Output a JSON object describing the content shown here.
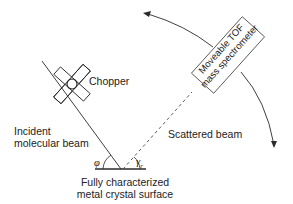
{
  "diagram": {
    "labels": {
      "chopper": "Chopper",
      "incident_line1": "Incident",
      "incident_line2": "molecular beam",
      "scattered": "Scattered beam",
      "spectrometer_line1": "Moveable TOF",
      "spectrometer_line2": "mass spectrometer",
      "surface_line1": "Fully characterized",
      "surface_line2": "metal crystal surface",
      "incident_angle": "φ",
      "scattered_angle": "γ",
      "scattered_angle_sub": "r"
    },
    "colors": {
      "line": "#2a2a2a",
      "text": "#222222",
      "background": "#ffffff"
    }
  }
}
